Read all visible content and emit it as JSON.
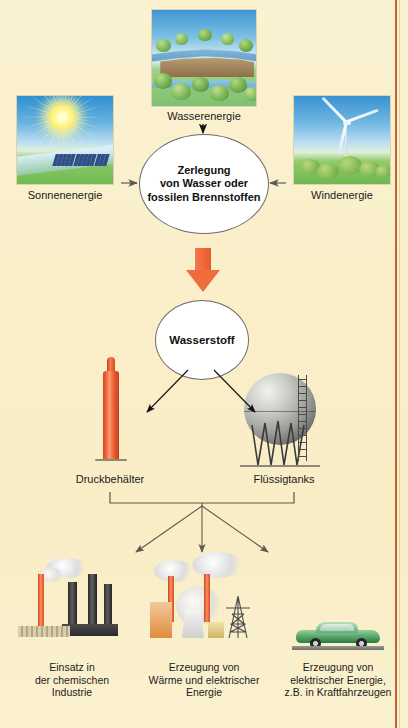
{
  "diagram": {
    "title_text": "",
    "background_color": "#faf0cd",
    "accent_color": "#ef6c3d",
    "rule_color": "#c0622c"
  },
  "sources": [
    {
      "id": "wasserenergie",
      "label": "Wasserenergie",
      "image": "hydro-dam-photo"
    },
    {
      "id": "sonnenenergie",
      "label": "Sonnenenergie",
      "image": "solar-sun-photo"
    },
    {
      "id": "windenergie",
      "label": "Windenergie",
      "image": "wind-turbine-photo"
    }
  ],
  "process_node": {
    "line1": "Zerlegung",
    "line2": "von Wasser oder",
    "line3": "fossilen Brennstoffen"
  },
  "product_node": {
    "label": "Wasserstoff"
  },
  "storage": [
    {
      "id": "druckbehaelter",
      "label": "Druckbehälter",
      "image": "gas-cylinder"
    },
    {
      "id": "fluessigtanks",
      "label": "Flüssigtanks",
      "image": "spherical-tank"
    }
  ],
  "applications": [
    {
      "id": "chemie",
      "image": "chemical-plant",
      "line1": "Einsatz in",
      "line2": "der chemischen",
      "line3": "Industrie"
    },
    {
      "id": "waerme-strom",
      "image": "power-plant",
      "line1": "Erzeugung von",
      "line2": "Wärme und elektrischer",
      "line3": "Energie"
    },
    {
      "id": "kraftfahrzeuge",
      "image": "green-car",
      "line1": "Erzeugung von",
      "line2": "elektrischer Energie,",
      "line3": "z.B. in Kraftfahrzeugen"
    }
  ]
}
